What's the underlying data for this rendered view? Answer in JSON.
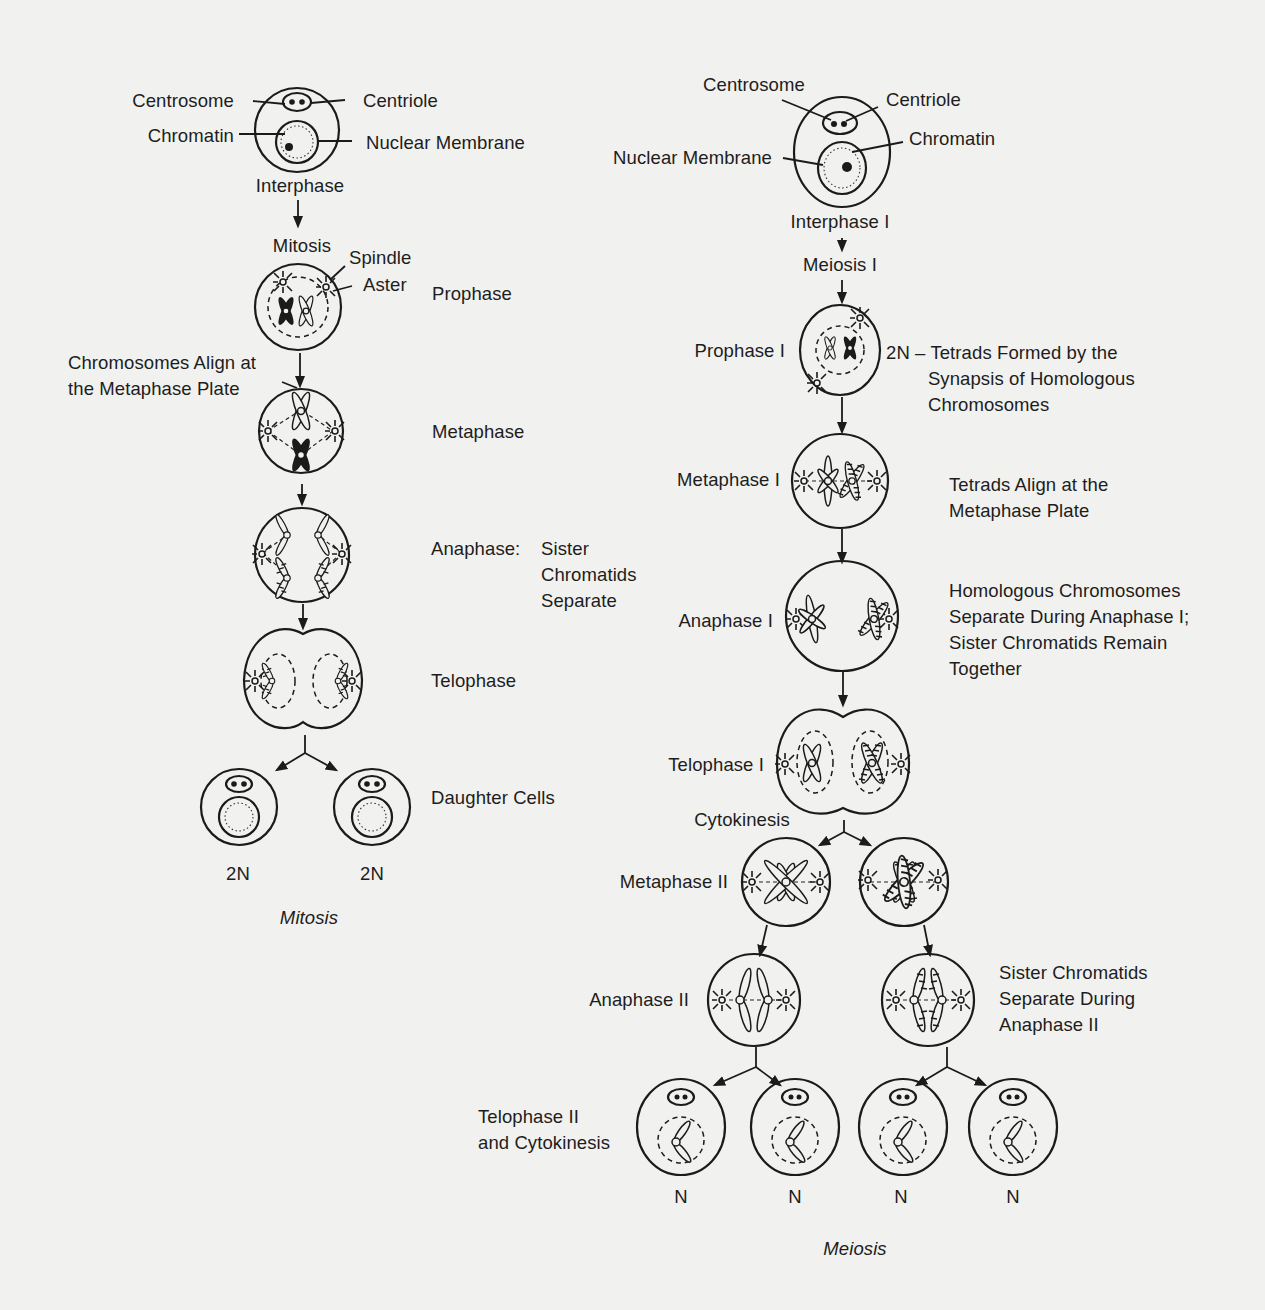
{
  "diagram": {
    "title_mitosis": "Mitosis",
    "title_meiosis": "Meiosis",
    "mitosis": {
      "interphase": {
        "stage": "Interphase",
        "labels": {
          "centrosome": "Centrosome",
          "centriole": "Centriole",
          "chromatin": "Chromatin",
          "nuclear_membrane": "Nuclear Membrane"
        }
      },
      "process_label": "Mitosis",
      "prophase": {
        "stage": "Prophase",
        "spindle": "Spindle",
        "aster": "Aster"
      },
      "metaphase": {
        "stage": "Metaphase",
        "note": "Chromosomes Align at\nthe Metaphase Plate"
      },
      "anaphase": {
        "stage": "Anaphase:",
        "note": "Sister\nChromatids\nSeparate"
      },
      "telophase": {
        "stage": "Telophase"
      },
      "daughter_cells": {
        "stage": "Daughter Cells",
        "ploidy": [
          "2N",
          "2N"
        ]
      }
    },
    "meiosis": {
      "interphase": {
        "stage": "Interphase I",
        "labels": {
          "centrosome": "Centrosome",
          "centriole": "Centriole",
          "chromatin": "Chromatin",
          "nuclear_membrane": "Nuclear Membrane"
        }
      },
      "process_label": "Meiosis I",
      "prophase_1": {
        "stage": "Prophase I",
        "note": "2N – Tetrads Formed by the\n        Synapsis of Homologous\n        Chromosomes"
      },
      "metaphase_1": {
        "stage": "Metaphase I",
        "note": "Tetrads Align at the\nMetaphase Plate"
      },
      "anaphase_1": {
        "stage": "Anaphase I",
        "note": "Homologous Chromosomes\nSeparate During Anaphase I;\nSister Chromatids Remain\nTogether"
      },
      "telophase_1": {
        "stage": "Telophase I",
        "cytokinesis": "Cytokinesis"
      },
      "metaphase_2": {
        "stage": "Metaphase II"
      },
      "anaphase_2": {
        "stage": "Anaphase II",
        "note": "Sister Chromatids\nSeparate During\nAnaphase II"
      },
      "telophase_2": {
        "stage": "Telophase II\nand Cytokinesis",
        "ploidy": [
          "N",
          "N",
          "N",
          "N"
        ]
      }
    }
  }
}
